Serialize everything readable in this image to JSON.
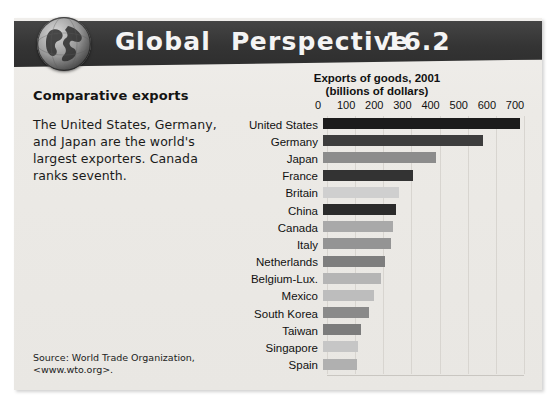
{
  "header": {
    "title_word1_cap": "G",
    "title_word1_rest": "lobal",
    "title_word2_cap": "P",
    "title_word2_rest": "erspective",
    "number": "16.2",
    "globe_icon": "globe-icon",
    "band_color": "#3a3a3a"
  },
  "left": {
    "heading": "Comparative exports",
    "body": "The United States, Germany, and Japan are the world's largest exporters. Canada ranks seventh.",
    "source_line1": "Source: World Trade Organization,",
    "source_line2": "<www.wto.org>."
  },
  "chart_data": {
    "type": "bar",
    "orientation": "horizontal",
    "title": "Exports of goods, 2001",
    "subtitle": "(billions of dollars)",
    "xlabel": "",
    "ylabel": "",
    "xlim": [
      0,
      700
    ],
    "grid": true,
    "legend": "none",
    "ticks": [
      0,
      100,
      200,
      300,
      400,
      500,
      600,
      700
    ],
    "tick_labels": [
      "0",
      "100",
      "200",
      "300",
      "400",
      "500",
      "600",
      "700"
    ],
    "categories": [
      "United States",
      "Germany",
      "Japan",
      "France",
      "Britain",
      "China",
      "Canada",
      "Italy",
      "Netherlands",
      "Belgium-Lux.",
      "Mexico",
      "South Korea",
      "Taiwan",
      "Singapore",
      "Spain"
    ],
    "values": [
      700,
      570,
      400,
      320,
      270,
      260,
      250,
      240,
      220,
      205,
      180,
      165,
      135,
      125,
      120
    ],
    "bar_colors": [
      "#1c1c1c",
      "#3d3d3d",
      "#8c8c8c",
      "#333333",
      "#cfcfcf",
      "#2b2b2b",
      "#a9a9a9",
      "#949494",
      "#7e7e7e",
      "#b5b5b5",
      "#bdbdbd",
      "#8a8a8a",
      "#7c7c7c",
      "#c6c6c6",
      "#b0b0b0"
    ]
  },
  "colors": {
    "panel_background": "#eceae6",
    "page_background": "#ffffff",
    "text": "#111111",
    "gridline": "#d8d5d0"
  }
}
